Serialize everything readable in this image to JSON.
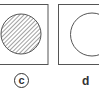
{
  "panels": [
    {
      "id": "c",
      "label": "c",
      "label_style": "circled",
      "circle_fill": "hatched"
    },
    {
      "id": "d",
      "label": "d",
      "label_style": "plain",
      "circle_fill": "empty"
    }
  ],
  "colors": {
    "stroke": "#555555",
    "hatch": "#444444",
    "background": "#ffffff"
  }
}
